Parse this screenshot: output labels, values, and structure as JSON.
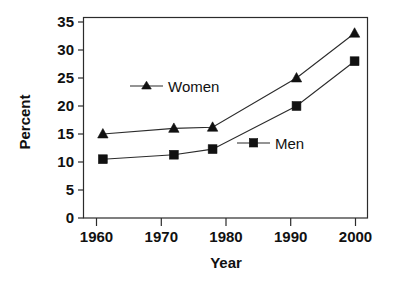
{
  "chart_data": {
    "type": "line",
    "title": "",
    "subtitle": "",
    "xlabel": "Year",
    "ylabel": "Percent",
    "xlim": [
      1958,
      2002
    ],
    "ylim": [
      0,
      35
    ],
    "grid": false,
    "legend_position": "inline-annotations",
    "x_ticks": [
      1960,
      1970,
      1980,
      1990,
      2000
    ],
    "x_tick_labels": [
      "1960",
      "1970",
      "1980",
      "1990",
      "2000"
    ],
    "y_ticks": [
      0,
      5,
      10,
      15,
      20,
      25,
      30,
      35
    ],
    "y_tick_labels": [
      "0",
      "5",
      "10",
      "15",
      "20",
      "25",
      "30",
      "35"
    ],
    "series": [
      {
        "name": "Women",
        "marker": "triangle",
        "x": [
          1961,
          1972,
          1978,
          1991,
          2000
        ],
        "values": [
          15.0,
          16.0,
          16.2,
          25.0,
          33.0
        ]
      },
      {
        "name": "Men",
        "marker": "square",
        "x": [
          1961,
          1972,
          1978,
          1991,
          2000
        ],
        "values": [
          10.5,
          11.3,
          12.3,
          20.0,
          28.0
        ]
      }
    ],
    "annotations": [
      {
        "text": "Women",
        "x": 1975.5,
        "y": 23.6
      },
      {
        "text": "Men",
        "x": 1988.0,
        "y": 13.4
      }
    ]
  },
  "axes": {
    "y_title": "Percent",
    "x_title": "Year"
  },
  "legend": {
    "women_label": "Women",
    "men_label": "Men"
  },
  "colors": {
    "line": "#2b2b2b",
    "marker": "#111111",
    "text": "#111111",
    "background": "#ffffff"
  }
}
